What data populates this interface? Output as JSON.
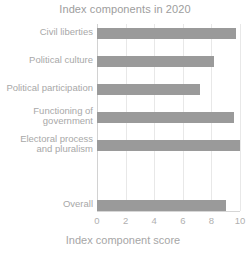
{
  "chart_data": {
    "type": "bar",
    "orientation": "horizontal",
    "title": "Index components in 2020",
    "xlabel": "Index component score",
    "ylabel": "",
    "categories": [
      "Civil liberties",
      "Political culture",
      "Political participation",
      "Functioning of\ngovernment",
      "Electoral process\nand pluralism",
      "Overall"
    ],
    "values": [
      9.7,
      8.2,
      7.2,
      9.6,
      10.0,
      9.0
    ],
    "xlim": [
      0,
      10
    ],
    "xticks": [
      0,
      2,
      4,
      6,
      8,
      10
    ],
    "xtick_labels": [
      "0",
      "2",
      "4",
      "6",
      "8",
      "10"
    ],
    "grid": true,
    "grid_axis": "x",
    "legend": "none",
    "bar_color": "#9a9a9a",
    "title_color": "#9d9d9d",
    "label_color": "#a8a8a8",
    "tick_color": "#b0b0b0",
    "grid_color": "#e8e8e8",
    "background": "#ffffff"
  }
}
